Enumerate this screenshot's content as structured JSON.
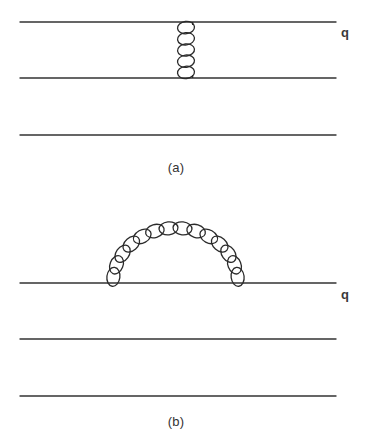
{
  "figure": {
    "background_color": "#ffffff",
    "line_color": "#333333",
    "coil_color": "#2b2b2b",
    "width": 374,
    "height": 440
  },
  "panels": [
    {
      "id": "a",
      "caption": "(a)",
      "description": "one-gluon exchange between two quark lines",
      "particle_label": "q",
      "fermion_lines": [
        {
          "name": "upper-quark-line",
          "x1": 20,
          "y1": 22,
          "x2": 336,
          "y2": 22
        },
        {
          "name": "middle-quark-line",
          "x1": 20,
          "y1": 78,
          "x2": 336,
          "y2": 78
        },
        {
          "name": "lower-quark-line",
          "x1": 20,
          "y1": 135,
          "x2": 336,
          "y2": 135
        }
      ],
      "gluon": {
        "name": "vertical-gluon-exchange",
        "shape": "vertical-spring",
        "x_center": 186,
        "y_top": 22,
        "y_bottom": 78,
        "coils": 5,
        "coil_width": 17,
        "coil_height": 11
      }
    },
    {
      "id": "b",
      "caption": "(b)",
      "description": "gluon self-energy loop on a single quark line",
      "particle_label": "q",
      "fermion_lines": [
        {
          "name": "upper-quark-line",
          "x1": 20,
          "y1": 283,
          "x2": 336,
          "y2": 283
        },
        {
          "name": "middle-quark-line",
          "x1": 20,
          "y1": 339,
          "x2": 336,
          "y2": 339
        },
        {
          "name": "lower-quark-line",
          "x1": 20,
          "y1": 396,
          "x2": 336,
          "y2": 396
        }
      ],
      "gluon": {
        "name": "gluon-loop-arc",
        "shape": "semicircular-spring",
        "x_left": 113,
        "x_right": 238,
        "y_baseline": 283,
        "arc_apex_y": 228,
        "radius": 62,
        "coils": 14,
        "coil_length": 19,
        "coil_width": 13
      }
    }
  ],
  "labels": {
    "caption_a": "(a)",
    "caption_b": "(b)",
    "quark_a": "q",
    "quark_b": "q"
  }
}
